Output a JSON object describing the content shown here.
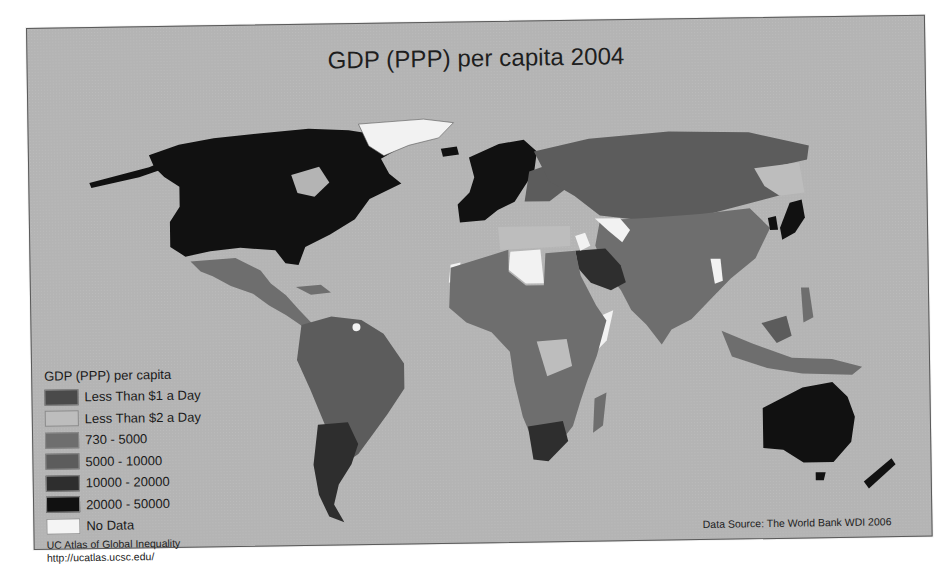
{
  "map": {
    "title": "GDP (PPP) per capita 2004",
    "projection": "world, Pacific cut (Americas left, Eurasia/Oceania right)",
    "ocean_color": "#b4b4b4"
  },
  "legend": {
    "title": "GDP (PPP) per capita",
    "items": [
      {
        "label": "Less Than $1 a Day",
        "color": "#4a4a4a"
      },
      {
        "label": "Less Than $2 a Day",
        "color": "#bdbdbd"
      },
      {
        "label": "730 - 5000",
        "color": "#6e6e6e"
      },
      {
        "label": "5000 - 10000",
        "color": "#5c5c5c"
      },
      {
        "label": "10000 - 20000",
        "color": "#2e2e2e"
      },
      {
        "label": "20000 - 50000",
        "color": "#111111"
      },
      {
        "label": "No Data",
        "color": "#f4f4f4"
      }
    ]
  },
  "credit": {
    "line1": "UC Atlas of Global Inequality",
    "line2": "http://ucatlas.ucsc.edu/"
  },
  "source": "Data Source: The World Bank WDI 2006",
  "regions": [
    {
      "name": "North America (USA/Canada)",
      "class": "20000 - 50000"
    },
    {
      "name": "Greenland",
      "class": "No Data"
    },
    {
      "name": "Mexico / Central America",
      "class": "730 - 5000"
    },
    {
      "name": "South America",
      "class": "5000 - 10000"
    },
    {
      "name": "Argentina / Chile",
      "class": "10000 - 20000"
    },
    {
      "name": "Western Europe",
      "class": "20000 - 50000"
    },
    {
      "name": "Russia / Central Asia",
      "class": "5000 - 10000"
    },
    {
      "name": "China / South Asia",
      "class": "730 - 5000"
    },
    {
      "name": "Japan / Korea",
      "class": "20000 - 50000"
    },
    {
      "name": "Saudi Arabia / Gulf",
      "class": "10000 - 20000"
    },
    {
      "name": "Libya / Afghanistan / Iraq / Myanmar / Somalia",
      "class": "No Data"
    },
    {
      "name": "Africa (most)",
      "class": "730 - 5000"
    },
    {
      "name": "South Africa",
      "class": "10000 - 20000"
    },
    {
      "name": "Australia / New Zealand",
      "class": "20000 - 50000"
    },
    {
      "name": "Southeast Asia / Indonesia",
      "class": "730 - 5000"
    }
  ]
}
